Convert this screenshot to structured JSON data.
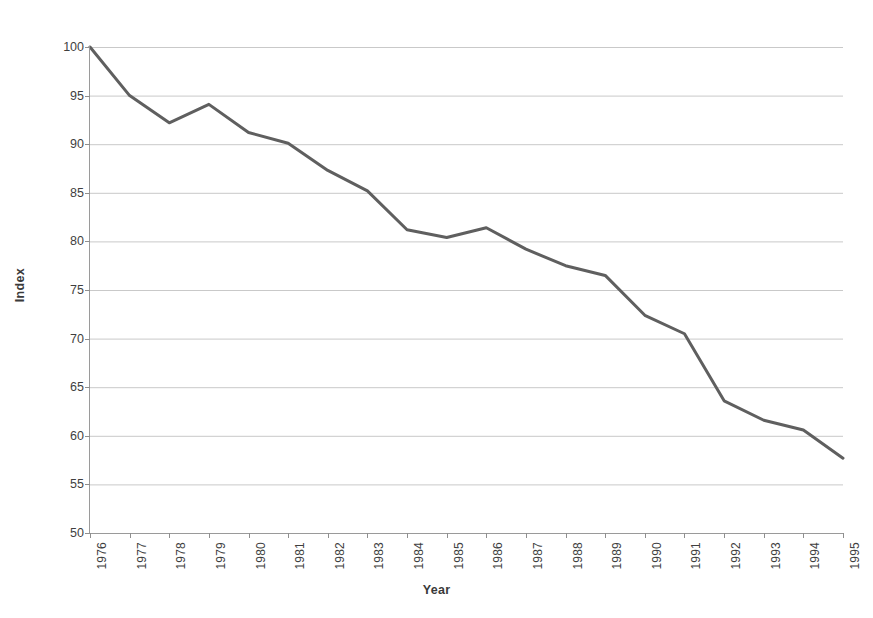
{
  "chart_data": {
    "type": "line",
    "title": "",
    "xlabel": "Year",
    "ylabel": "Index",
    "x": [
      1976,
      1977,
      1978,
      1979,
      1980,
      1981,
      1982,
      1983,
      1984,
      1985,
      1986,
      1987,
      1988,
      1989,
      1990,
      1991,
      1992,
      1993,
      1994,
      1995
    ],
    "categories": [
      "1976",
      "1977",
      "1978",
      "1979",
      "1980",
      "1981",
      "1982",
      "1983",
      "1984",
      "1985",
      "1986",
      "1987",
      "1988",
      "1989",
      "1990",
      "1991",
      "1992",
      "1993",
      "1994",
      "1995"
    ],
    "values": [
      100.0,
      95.0,
      92.2,
      94.1,
      91.2,
      90.1,
      87.3,
      85.2,
      81.2,
      80.4,
      81.4,
      79.2,
      77.5,
      76.5,
      72.4,
      70.5,
      63.6,
      61.6,
      60.6,
      57.7
    ],
    "series": [
      {
        "name": "Index",
        "color": "#5f5f5f",
        "values": [
          100.0,
          95.0,
          92.2,
          94.1,
          91.2,
          90.1,
          87.3,
          85.2,
          81.2,
          80.4,
          81.4,
          79.2,
          77.5,
          76.5,
          72.4,
          70.5,
          63.6,
          61.6,
          60.6,
          57.7
        ]
      }
    ],
    "ylim": [
      50,
      100
    ],
    "yticks": [
      50,
      55,
      60,
      65,
      70,
      75,
      80,
      85,
      90,
      95,
      100
    ],
    "ytick_labels": [
      "50",
      "55",
      "60",
      "65",
      "70",
      "75",
      "80",
      "85",
      "90",
      "95",
      "100"
    ],
    "grid": "horizontal",
    "grid_color": "#c9c9c9",
    "legend": "none",
    "background": "#ffffff",
    "axis_color": "#9a9a9a",
    "xtick_rotation": -90
  }
}
